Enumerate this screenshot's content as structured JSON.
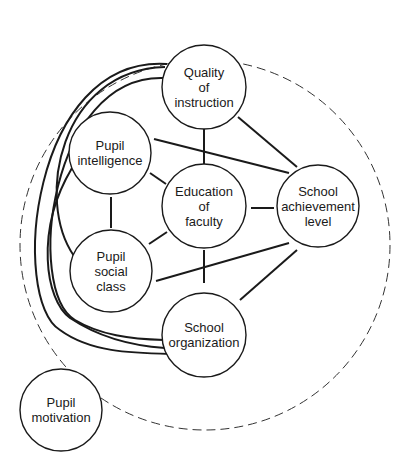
{
  "diagram": {
    "boundary": {
      "shape": "dashed-circle",
      "cx": 205,
      "cy": 245,
      "r": 185
    },
    "nodes": [
      {
        "id": "quality",
        "lines": [
          "Quality",
          "of",
          "instruction"
        ],
        "cx": 204,
        "cy": 87,
        "r": 42
      },
      {
        "id": "intelligence",
        "lines": [
          "Pupil",
          "intelligence"
        ],
        "cx": 110,
        "cy": 153,
        "r": 41
      },
      {
        "id": "education",
        "lines": [
          "Education",
          "of",
          "faculty"
        ],
        "cx": 204,
        "cy": 206,
        "r": 42
      },
      {
        "id": "achievement",
        "lines": [
          "School",
          "achievement",
          "level"
        ],
        "cx": 318,
        "cy": 206,
        "r": 41
      },
      {
        "id": "social",
        "lines": [
          "Pupil",
          "social",
          "class"
        ],
        "cx": 111,
        "cy": 271,
        "r": 41
      },
      {
        "id": "organization",
        "lines": [
          "School",
          "organization"
        ],
        "cx": 204,
        "cy": 335,
        "r": 42
      },
      {
        "id": "motivation",
        "lines": [
          "Pupil",
          "motivation"
        ],
        "cx": 61,
        "cy": 410,
        "r": 41
      }
    ],
    "edges": [
      [
        "quality",
        "education"
      ],
      [
        "quality",
        "achievement"
      ],
      [
        "intelligence",
        "achievement"
      ],
      [
        "intelligence",
        "education"
      ],
      [
        "intelligence",
        "social"
      ],
      [
        "education",
        "achievement"
      ],
      [
        "education",
        "social"
      ],
      [
        "education",
        "organization"
      ],
      [
        "social",
        "achievement"
      ],
      [
        "organization",
        "achievement"
      ],
      [
        "quality",
        "social"
      ],
      [
        "quality",
        "organization"
      ],
      [
        "intelligence",
        "organization"
      ],
      [
        "social",
        "quality"
      ]
    ]
  }
}
